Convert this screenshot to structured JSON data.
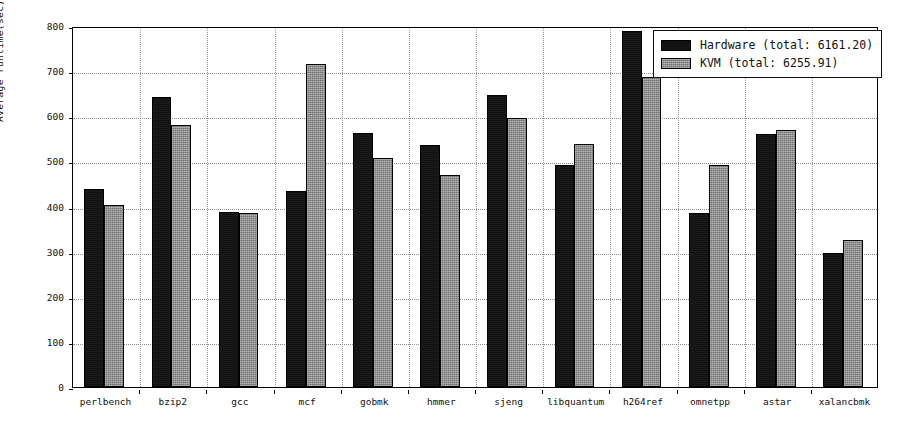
{
  "chart_data": {
    "type": "bar",
    "title": "",
    "xlabel": "",
    "ylabel": "Average runtime(sec)",
    "ylim": [
      0,
      800
    ],
    "yticks": [
      0,
      100,
      200,
      300,
      400,
      500,
      600,
      700,
      800
    ],
    "grid": true,
    "legend_position": "upper right",
    "categories": [
      "perlbench",
      "bzip2",
      "gcc",
      "mcf",
      "gobmk",
      "hmmer",
      "sjeng",
      "libquantum",
      "h264ref",
      "omnetpp",
      "astar",
      "xalancbmk"
    ],
    "series": [
      {
        "name": "Hardware",
        "legend_label": "Hardware (total: 6161.20)",
        "total": "6161.20",
        "color": "#121212",
        "values": [
          439,
          642,
          388,
          434,
          563,
          537,
          648,
          492,
          789,
          385,
          560,
          297
        ]
      },
      {
        "name": "KVM",
        "legend_label": "KVM (total: 6255.91)",
        "total": "6255.91",
        "color": "#8a8a8a",
        "values": [
          404,
          580,
          386,
          716,
          508,
          470,
          596,
          539,
          688,
          491,
          570,
          325
        ]
      }
    ]
  },
  "colors": {
    "hardware": "#121212",
    "kvm": "#8a8a8a",
    "axis": "#000000",
    "grid": "#8d8d8d",
    "background": "#ffffff"
  }
}
